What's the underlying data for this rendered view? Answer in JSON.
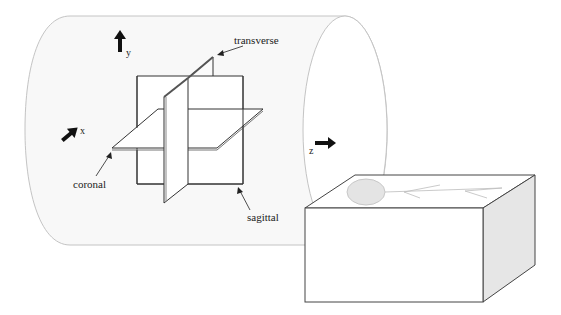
{
  "diagram": {
    "type": "anatomical-planes-schematic",
    "axes": {
      "x": "x",
      "y": "y",
      "z": "z"
    },
    "planes": {
      "transverse": "transverse",
      "coronal": "coronal",
      "sagittal": "sagittal"
    },
    "colors": {
      "cylinder_fill": "#f8f8f8",
      "cylinder_stroke": "#c4c4c4",
      "plane_stroke": "#333333",
      "box_stroke": "#444444",
      "box_side_fill": "#e6e6e6",
      "head_fill": "#e4e4e4",
      "body_lines": "#bdbdbd",
      "arrow_fill": "#111111"
    }
  }
}
